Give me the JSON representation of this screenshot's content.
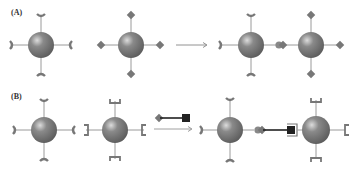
{
  "panels": [
    {
      "label": "(A)",
      "description": "Sphere with Y-shaped receptors plus sphere with diamond ligands yields bound dimer"
    },
    {
      "label": "(B)",
      "description": "Sphere with Y-shaped receptors plus sphere with bracket receptors plus diamond–square linker yields linked dimer"
    }
  ],
  "colors": {
    "sphere": "#7a7a7a",
    "sphere_highlight": "#d8d8d8",
    "stalk": "#9a9a9a",
    "ligand": "#777777",
    "linker": "#222222",
    "arrow": "#777777"
  }
}
